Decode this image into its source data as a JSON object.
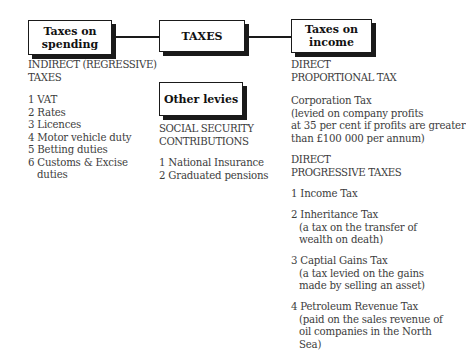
{
  "boxes": {
    "spending": "Taxes on\nspending",
    "spending_l1": "Taxes on",
    "spending_l2": "spending",
    "taxes": "TAXES",
    "income_l1": "Taxes on",
    "income_l2": "income",
    "other": "Other levies"
  },
  "left": {
    "heading": [
      "INDIRECT (REGRESSIVE)",
      "TAXES"
    ],
    "items": [
      "1 VAT",
      "2 Rates",
      "3 Licences",
      "4 Motor vehicle duty",
      "5 Betting duties",
      "6 Customs & Excise",
      "duties"
    ]
  },
  "middle": {
    "heading": [
      "SOCIAL SECURITY",
      "CONTRIBUTIONS"
    ],
    "items": [
      "1 National Insurance",
      "2 Graduated pensions"
    ]
  },
  "right": {
    "proportional_heading": [
      "DIRECT",
      "PROPORTIONAL TAX"
    ],
    "corporation": [
      "Corporation Tax",
      "(levied on company profits",
      "at 35 per cent if profits are greater",
      "than £100 000 per annum)"
    ],
    "progressive_heading": [
      "DIRECT",
      "PROGRESSIVE TAXES"
    ],
    "income_tax": "1 Income Tax",
    "inheritance": [
      "2 Inheritance Tax",
      "(a tax on the transfer of",
      "wealth on death)"
    ],
    "cgt": [
      "3 Captial Gains Tax",
      "(a tax levied on the gains",
      "made by selling an asset)"
    ],
    "petroleum": [
      "4 Petroleum Revenue Tax",
      "(paid on the sales revenue of",
      "oil companies in the North",
      "Sea)"
    ]
  }
}
